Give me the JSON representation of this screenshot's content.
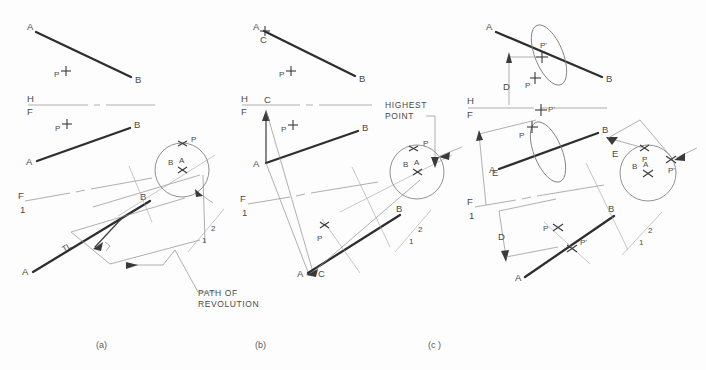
{
  "figure": {
    "title_labels": [
      "(a)",
      "(b)",
      "(c)"
    ],
    "notes": {
      "path_of_revolution": [
        "PATH OF",
        "REVOLUTION"
      ],
      "highest_point": [
        "HIGHEST",
        "POINT"
      ]
    }
  },
  "panels": [
    {
      "id": "a",
      "caption": "(a)",
      "top_view": {
        "line_labels": {
          "start": "A",
          "end": "B"
        },
        "point_label": "P"
      },
      "fold_line": {
        "upper": "H",
        "lower": "F"
      },
      "front_view": {
        "line_labels": {
          "start": "A",
          "end": "B"
        },
        "point_label": "P"
      },
      "fold_line_2": {
        "upper": "F",
        "lower": "1"
      },
      "aux_view": {
        "line_labels": {
          "start": "A",
          "end": "B"
        },
        "true_length_label": "TL",
        "point_label": "P"
      },
      "fold_line_3": {
        "upper": "2",
        "lower": "1"
      },
      "point_view": {
        "center_labels": [
          "B",
          "A"
        ],
        "point_label": "P"
      },
      "annotation": "PATH OF REVOLUTION"
    },
    {
      "id": "b",
      "caption": "(b)",
      "top_view": {
        "line_labels": {
          "start": "A",
          "end": "B"
        },
        "revolved_label": "C",
        "point_label": "P"
      },
      "fold_line": {
        "upper": "H",
        "lower": "F"
      },
      "front_view": {
        "line_labels": {
          "start": "A",
          "end": "B"
        },
        "revolved_label": "C",
        "point_label": "P"
      },
      "fold_line_2": {
        "upper": "F",
        "lower": "1"
      },
      "aux_view": {
        "line_labels": {
          "start": "A",
          "end": "B"
        },
        "revolved_label": "C",
        "point_label": "P"
      },
      "fold_line_3": {
        "upper": "2",
        "lower": "1"
      },
      "point_view": {
        "center_labels": [
          "B",
          "A"
        ],
        "point_label": "P"
      },
      "annotation": "HIGHEST POINT"
    },
    {
      "id": "c",
      "caption": "(c )",
      "top_view": {
        "line_labels": {
          "start": "A",
          "end": "B"
        },
        "point_label": "P",
        "revolved_point_label": "P'",
        "dimension_label": "D"
      },
      "fold_line": {
        "upper": "H",
        "lower": "F"
      },
      "front_view": {
        "line_labels": {
          "start": "A",
          "end": "B"
        },
        "point_label": "P",
        "revolved_point_label": "P'",
        "dimension_label": "E"
      },
      "fold_line_2": {
        "upper": "F",
        "lower": "1"
      },
      "aux_view": {
        "line_labels": {
          "start": "A",
          "end": "B"
        },
        "point_label": "P",
        "revolved_point_label": "P'",
        "dimension_label": "D"
      },
      "fold_line_3": {
        "upper": "2",
        "lower": "1"
      },
      "point_view": {
        "center_labels": [
          "B",
          "A"
        ],
        "point_label": "P",
        "revolved_point_label": "P'",
        "dimension_label": "E"
      }
    }
  ],
  "colors": {
    "background": "#fdfdfd",
    "heavy_line": "#2e2e2e",
    "construction_line": "#9a9a9a",
    "text": "#4a4a4a"
  }
}
